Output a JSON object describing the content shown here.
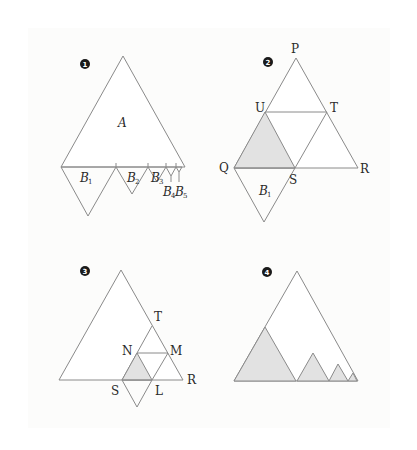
{
  "figures": [
    {
      "id": "fig1",
      "badge": "1",
      "region_label": "A",
      "b_labels": [
        {
          "main": "B",
          "sub": "1"
        },
        {
          "main": "B",
          "sub": "2"
        },
        {
          "main": "B",
          "sub": "3"
        },
        {
          "main": "B",
          "sub": "4"
        },
        {
          "main": "B",
          "sub": "5"
        }
      ]
    },
    {
      "id": "fig2",
      "badge": "2",
      "points": {
        "P": "P",
        "U": "U",
        "T": "T",
        "Q": "Q",
        "S": "S",
        "R": "R"
      },
      "b_label": {
        "main": "B",
        "sub": "1"
      }
    },
    {
      "id": "fig3",
      "badge": "3",
      "points": {
        "T": "T",
        "N": "N",
        "M": "M",
        "S": "S",
        "L": "L",
        "R": "R"
      }
    },
    {
      "id": "fig4",
      "badge": "4"
    }
  ],
  "colors": {
    "stroke": "#8a8a8a",
    "shade": "#e2e2e2",
    "badge": "#1a1a1a"
  }
}
